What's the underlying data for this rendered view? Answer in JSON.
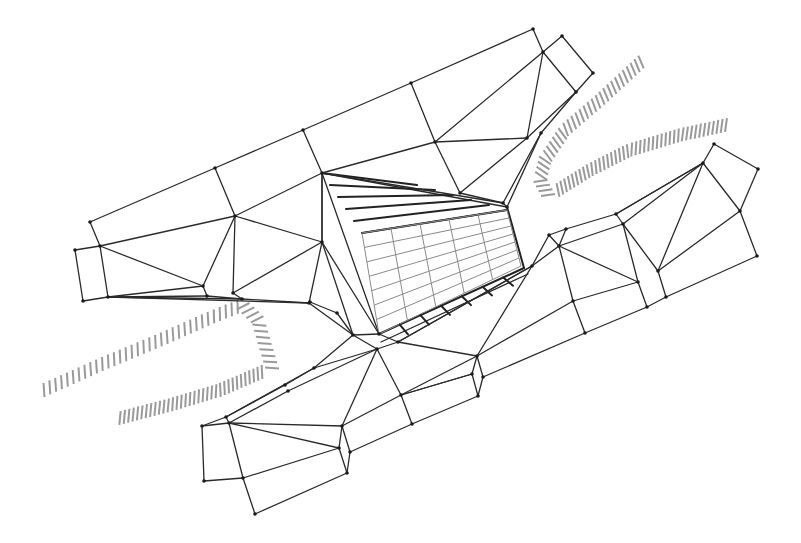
{
  "drawing": {
    "type": "architectural-plan-line-drawing",
    "description": "Triangulated mesh plan of a building complex with a central gridded courtyard and hatched contour lines",
    "colors": {
      "background": "#ffffff",
      "line": "#2a2a2a",
      "grid": "#8a8a8a",
      "hatch": "#9a9a9a",
      "node": "#1a1a1a"
    },
    "nodes": {
      "a1": [
        90,
        222
      ],
      "a2": [
        75,
        250
      ],
      "a3": [
        100,
        246
      ],
      "a4": [
        83,
        301
      ],
      "a5": [
        108,
        297
      ],
      "b1": [
        215,
        168
      ],
      "b2": [
        235,
        216
      ],
      "b3": [
        203,
        286
      ],
      "b4": [
        207,
        296
      ],
      "b5": [
        233,
        293
      ],
      "b6": [
        242,
        299
      ],
      "c1": [
        303,
        130
      ],
      "c2": [
        322,
        173
      ],
      "c3": [
        322,
        242
      ],
      "c4": [
        309,
        303
      ],
      "d1": [
        411,
        83
      ],
      "d2": [
        435,
        142
      ],
      "d3": [
        460,
        193
      ],
      "e1": [
        533,
        29
      ],
      "e2": [
        543,
        52
      ],
      "e3": [
        562,
        36
      ],
      "e4": [
        593,
        73
      ],
      "e5": [
        576,
        92
      ],
      "e6": [
        527,
        138
      ],
      "e7": [
        541,
        133
      ],
      "e8": [
        503,
        203
      ],
      "e9": [
        507,
        207
      ],
      "f1": [
        532,
        266
      ],
      "f2": [
        549,
        235
      ],
      "f3": [
        566,
        229
      ],
      "f4": [
        559,
        246
      ],
      "f5": [
        616,
        214
      ],
      "f6": [
        623,
        224
      ],
      "f7": [
        573,
        301
      ],
      "f8": [
        585,
        333
      ],
      "g1": [
        703,
        163
      ],
      "g2": [
        714,
        144
      ],
      "g3": [
        758,
        169
      ],
      "g4": [
        740,
        211
      ],
      "g5": [
        757,
        256
      ],
      "g6": [
        658,
        271
      ],
      "g7": [
        638,
        282
      ],
      "g8": [
        666,
        297
      ],
      "g9": [
        647,
        307
      ],
      "h1": [
        477,
        356
      ],
      "h2": [
        472,
        374
      ],
      "h3": [
        483,
        377
      ],
      "h4": [
        478,
        396
      ],
      "k1": [
        310,
        302
      ],
      "k2": [
        337,
        313
      ],
      "k3": [
        353,
        335
      ],
      "k4": [
        379,
        334
      ],
      "k5": [
        377,
        349
      ],
      "k6": [
        398,
        342
      ],
      "k7": [
        401,
        395
      ],
      "k8": [
        412,
        424
      ],
      "k9": [
        314,
        368
      ],
      "k10": [
        285,
        385
      ],
      "k11": [
        288,
        391
      ],
      "m1": [
        202,
        426
      ],
      "m2": [
        226,
        417
      ],
      "m3": [
        229,
        423
      ],
      "m4": [
        204,
        481
      ],
      "m5": [
        243,
        478
      ],
      "m6": [
        255,
        514
      ],
      "m7": [
        342,
        426
      ],
      "m8": [
        339,
        448
      ],
      "m9": [
        350,
        452
      ],
      "m10": [
        347,
        473
      ]
    },
    "courtyard": {
      "corners": {
        "top_left": [
          322,
          173
        ],
        "top_right": [
          507,
          207
        ],
        "bottom_right": [
          524,
          268
        ],
        "bottom_left": [
          379,
          334
        ]
      },
      "inner_top_left": [
        362,
        233
      ],
      "inner_top_right": [
        507,
        210
      ],
      "grid_columns": 5,
      "grid_rows": 7,
      "roof_hatch_lines": 5,
      "step_marks": 6
    },
    "contour_hatches": [
      {
        "name": "upper-right-contour-a",
        "count": 34
      },
      {
        "name": "upper-right-contour-b",
        "count": 42
      },
      {
        "name": "lower-left-contour-a",
        "count": 46
      },
      {
        "name": "lower-left-contour-b",
        "count": 34
      }
    ]
  }
}
